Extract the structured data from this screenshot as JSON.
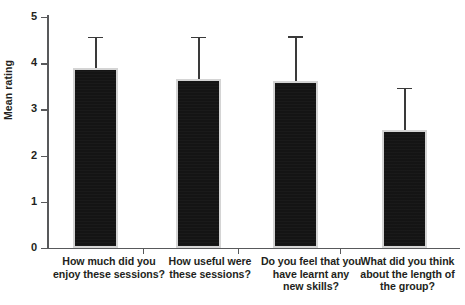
{
  "chart_data": {
    "type": "bar",
    "title": "",
    "xlabel": "",
    "ylabel": "Mean rating",
    "ylim": [
      0,
      5
    ],
    "yticks": [
      0,
      1,
      2,
      3,
      4,
      5
    ],
    "ytick_labels": [
      "0",
      "1",
      "2",
      "3",
      "4",
      "5"
    ],
    "grid": false,
    "legend": null,
    "error_bars": "upper-only",
    "bar_color": "#141414",
    "bar_edge_color": "#d4d4d4",
    "axis_color": "#58595b",
    "categories": [
      "How much did you enjoy these sessions?",
      "How useful were these sessions?",
      "Do you feel that you have learnt any new skills?",
      "What did you think about the length of the group?"
    ],
    "category_lines": [
      [
        "How much did you",
        "enjoy these sessions?"
      ],
      [
        "How useful were",
        "these sessions?"
      ],
      [
        "Do you feel that you",
        "have learnt any",
        "new skills?"
      ],
      [
        "What did you think",
        "about the length of",
        "the group?"
      ]
    ],
    "values": [
      3.9,
      3.66,
      3.62,
      2.55
    ],
    "error_upper": [
      0.67,
      0.91,
      0.96,
      0.92
    ],
    "error_tops": [
      4.57,
      4.57,
      4.58,
      3.47
    ]
  },
  "axis": {
    "y_label": "Mean rating",
    "tick_0": "0",
    "tick_1": "1",
    "tick_2": "2",
    "tick_3": "3",
    "tick_4": "4",
    "tick_5": "5"
  }
}
